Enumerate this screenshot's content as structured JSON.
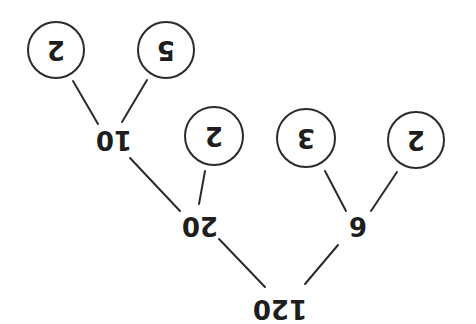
{
  "diagram": {
    "type": "factor-tree",
    "orientation": "rotated-180",
    "colors": {
      "line": "#2b2b2b",
      "text": "#1e1e1e",
      "background": "#ffffff"
    },
    "root": {
      "label": "120",
      "x": 280,
      "y": 309
    },
    "nodes": [
      {
        "id": "n20",
        "label": "20",
        "x": 200,
        "y": 226
      },
      {
        "id": "n6",
        "label": "6",
        "x": 358,
        "y": 226
      },
      {
        "id": "n10",
        "label": "10",
        "x": 114,
        "y": 140
      }
    ],
    "leaves": [
      {
        "id": "l2a",
        "label": "2",
        "cx": 56,
        "cy": 50,
        "r": 28
      },
      {
        "id": "l5",
        "label": "5",
        "cx": 166,
        "cy": 50,
        "r": 28
      },
      {
        "id": "l2b",
        "label": "2",
        "cx": 214,
        "cy": 136,
        "r": 29
      },
      {
        "id": "l3",
        "label": "3",
        "cx": 306,
        "cy": 138,
        "r": 29
      },
      {
        "id": "l2c",
        "label": "2",
        "cx": 416,
        "cy": 140,
        "r": 28
      }
    ],
    "edges": [
      {
        "from": "120",
        "to": "20",
        "x1": 265,
        "y1": 287,
        "x2": 219,
        "y2": 239
      },
      {
        "from": "120",
        "to": "6",
        "x1": 305,
        "y1": 284,
        "x2": 338,
        "y2": 245
      },
      {
        "from": "20",
        "to": "10",
        "x1": 180,
        "y1": 211,
        "x2": 130,
        "y2": 158
      },
      {
        "from": "20",
        "to": "2",
        "x1": 199,
        "y1": 204,
        "x2": 205,
        "y2": 171
      },
      {
        "from": "10",
        "to": "2",
        "x1": 98,
        "y1": 124,
        "x2": 73,
        "y2": 81
      },
      {
        "from": "10",
        "to": "5",
        "x1": 122,
        "y1": 122,
        "x2": 147,
        "y2": 80
      },
      {
        "from": "6",
        "to": "3",
        "x1": 346,
        "y1": 211,
        "x2": 325,
        "y2": 171
      },
      {
        "from": "6",
        "to": "2",
        "x1": 371,
        "y1": 211,
        "x2": 397,
        "y2": 172
      }
    ]
  }
}
